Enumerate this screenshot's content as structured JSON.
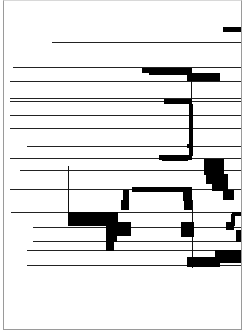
{
  "figure": {
    "type": "scanned-diagram",
    "frame": {
      "x": 3,
      "y": 0,
      "w": 239,
      "h": 330
    },
    "hlines": [
      {
        "x1": 52,
        "x2": 241,
        "y": 42
      },
      {
        "x1": 13,
        "x2": 241,
        "y": 67
      },
      {
        "x1": 10,
        "x2": 241,
        "y": 81
      },
      {
        "x1": 10,
        "x2": 241,
        "y": 98
      },
      {
        "x1": 10,
        "x2": 241,
        "y": 101
      },
      {
        "x1": 10,
        "x2": 241,
        "y": 115
      },
      {
        "x1": 10,
        "x2": 241,
        "y": 128
      },
      {
        "x1": 27,
        "x2": 241,
        "y": 146
      },
      {
        "x1": 10,
        "x2": 241,
        "y": 158
      },
      {
        "x1": 20,
        "x2": 241,
        "y": 170
      },
      {
        "x1": 10,
        "x2": 241,
        "y": 189
      },
      {
        "x1": 11,
        "x2": 241,
        "y": 212
      },
      {
        "x1": 33,
        "x2": 241,
        "y": 227
      },
      {
        "x1": 33,
        "x2": 241,
        "y": 241
      },
      {
        "x1": 27,
        "x2": 241,
        "y": 250
      },
      {
        "x1": 27,
        "x2": 241,
        "y": 265
      }
    ],
    "vlines": [
      {
        "x": 191,
        "y1": 70,
        "y2": 160
      },
      {
        "x": 68,
        "y1": 166,
        "y2": 212
      },
      {
        "x": 192,
        "y1": 200,
        "y2": 268
      }
    ],
    "blocks": [
      {
        "x": 223,
        "y": 27,
        "w": 18,
        "h": 5
      },
      {
        "x": 142,
        "y": 68,
        "w": 50,
        "h": 5
      },
      {
        "x": 149,
        "y": 72,
        "w": 40,
        "h": 3
      },
      {
        "x": 187,
        "y": 73,
        "w": 33,
        "h": 8
      },
      {
        "x": 164,
        "y": 99,
        "w": 28,
        "h": 5
      },
      {
        "x": 189,
        "y": 104,
        "w": 4,
        "h": 52
      },
      {
        "x": 187,
        "y": 144,
        "w": 5,
        "h": 4
      },
      {
        "x": 159,
        "y": 155,
        "w": 33,
        "h": 5
      },
      {
        "x": 162,
        "y": 159,
        "w": 26,
        "h": 2
      },
      {
        "x": 204,
        "y": 159,
        "w": 20,
        "h": 16
      },
      {
        "x": 206,
        "y": 174,
        "w": 22,
        "h": 10
      },
      {
        "x": 212,
        "y": 183,
        "w": 16,
        "h": 8
      },
      {
        "x": 223,
        "y": 190,
        "w": 11,
        "h": 10
      },
      {
        "x": 132,
        "y": 187,
        "w": 60,
        "h": 5
      },
      {
        "x": 123,
        "y": 190,
        "w": 6,
        "h": 12
      },
      {
        "x": 121,
        "y": 200,
        "w": 8,
        "h": 10
      },
      {
        "x": 183,
        "y": 187,
        "w": 9,
        "h": 14
      },
      {
        "x": 184,
        "y": 200,
        "w": 8,
        "h": 10
      },
      {
        "x": 68,
        "y": 212,
        "w": 50,
        "h": 14
      },
      {
        "x": 106,
        "y": 222,
        "w": 25,
        "h": 14
      },
      {
        "x": 106,
        "y": 234,
        "w": 11,
        "h": 8
      },
      {
        "x": 106,
        "y": 241,
        "w": 8,
        "h": 10
      },
      {
        "x": 181,
        "y": 222,
        "w": 13,
        "h": 15
      },
      {
        "x": 232,
        "y": 212,
        "w": 9,
        "h": 4
      },
      {
        "x": 231,
        "y": 214,
        "w": 4,
        "h": 12
      },
      {
        "x": 226,
        "y": 222,
        "w": 8,
        "h": 8
      },
      {
        "x": 236,
        "y": 230,
        "w": 5,
        "h": 12
      },
      {
        "x": 215,
        "y": 250,
        "w": 26,
        "h": 13
      },
      {
        "x": 187,
        "y": 257,
        "w": 33,
        "h": 10
      }
    ]
  }
}
